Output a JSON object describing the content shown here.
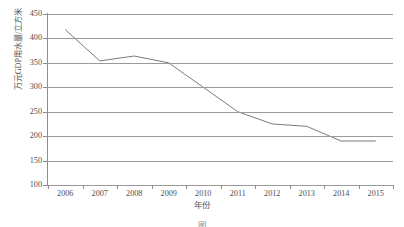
{
  "chart_data": {
    "type": "line",
    "title": "",
    "xlabel": "年份",
    "ylabel": "万元GDP用水量/立方米",
    "categories": [
      "2006",
      "2007",
      "2008",
      "2009",
      "2010",
      "2011",
      "2012",
      "2013",
      "2014",
      "2015"
    ],
    "values": [
      418,
      354,
      364,
      350,
      300,
      250,
      225,
      220,
      190,
      190
    ],
    "series": [
      {
        "name": "万元GDP用水量",
        "values": [
          418,
          354,
          364,
          350,
          300,
          250,
          225,
          220,
          190,
          190
        ]
      }
    ],
    "ylim": [
      100,
      450
    ],
    "yticks": [
      100,
      150,
      200,
      250,
      300,
      350,
      400,
      450
    ],
    "ytick_labels": [
      "100",
      "150",
      "200",
      "250",
      "300",
      "350",
      "400",
      "450"
    ],
    "xtick_labels": [
      "2006",
      "2007",
      "2008",
      "2009",
      "2010",
      "2011",
      "2012",
      "2013",
      "2014",
      "2015"
    ],
    "grid": "horizontal",
    "legend": "none",
    "line_color": "#7b7b80",
    "grid_color": "#9a9a9a",
    "axis_color": "#8e8e8e",
    "background": "#ffffff"
  },
  "figure": {
    "caption": "图",
    "x_axis_title": "年份",
    "y_axis_title": "万元GDP用水量/立方米"
  }
}
